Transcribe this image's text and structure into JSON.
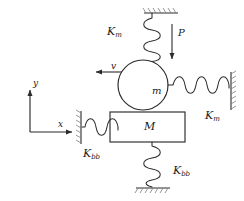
{
  "figure": {
    "type": "free-body-diagram",
    "background_color": "#ffffff",
    "line_color": "#2b2b2b",
    "fill_color": "#ffffff",
    "width": 244,
    "height": 201
  },
  "axes": {
    "x_label": "x",
    "y_label": "y",
    "origin": {
      "x": 30,
      "y": 132
    },
    "x_length": 42,
    "y_length": 42
  },
  "bodies": {
    "circle": {
      "label": "m",
      "cx": 143,
      "cy": 85,
      "r": 25
    },
    "block": {
      "label": "M",
      "x": 110,
      "y": 112,
      "width": 75,
      "height": 30
    }
  },
  "springs": {
    "top": {
      "label_k": "K",
      "label_sub": "m",
      "orientation": "vertical",
      "label_x": 107,
      "label_y": 26
    },
    "right": {
      "label_k": "K",
      "label_sub": "m",
      "orientation": "horizontal",
      "label_x": 205,
      "label_y": 110
    },
    "left": {
      "label_k": "K",
      "label_sub": "bb",
      "orientation": "horizontal",
      "label_x": 83,
      "label_y": 148
    },
    "bottom": {
      "label_k": "K",
      "label_sub": "bb",
      "orientation": "vertical",
      "label_x": 173,
      "label_y": 165
    }
  },
  "annotations": {
    "force": {
      "label": "P",
      "label_x": 178,
      "label_y": 28,
      "direction": "down"
    },
    "velocity": {
      "label": "v",
      "label_x": 111,
      "label_y": 62,
      "direction": "left"
    }
  }
}
